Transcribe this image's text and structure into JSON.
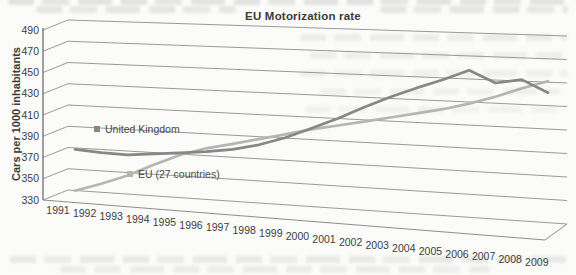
{
  "title": "EU Motorization rate",
  "y_axis": {
    "title": "Cars per 1000 inhabitants",
    "min": 330,
    "max": 490,
    "step": 20,
    "ticks": [
      330,
      350,
      370,
      390,
      410,
      430,
      450,
      470,
      490
    ]
  },
  "x_axis": {
    "years": [
      1991,
      1992,
      1993,
      1994,
      1995,
      1996,
      1997,
      1998,
      1999,
      2000,
      2001,
      2002,
      2003,
      2004,
      2005,
      2006,
      2007,
      2008,
      2009
    ]
  },
  "chart_data": {
    "type": "line",
    "title": "EU Motorization rate",
    "xlabel": "",
    "ylabel": "Cars per 1000 inhabitants",
    "ylim": [
      330,
      490
    ],
    "grid": true,
    "projection": "3d-perspective",
    "legend_position": "inline-labels",
    "categories": [
      1991,
      1992,
      1993,
      1994,
      1995,
      1996,
      1997,
      1998,
      1999,
      2000,
      2001,
      2002,
      2003,
      2004,
      2005,
      2006,
      2007,
      2008,
      2009
    ],
    "series": [
      {
        "name": "EU (27 countries)",
        "color": "#b5b5b5",
        "values": [
          335,
          343,
          352,
          363,
          373,
          380,
          385,
          390,
          395,
          400,
          404,
          408,
          412,
          416,
          420,
          425,
          431,
          438,
          444
        ]
      },
      {
        "name": "United Kingdom",
        "color": "#878787",
        "values": [
          374,
          372,
          371,
          373,
          375,
          377,
          380,
          385,
          392,
          401,
          410,
          420,
          429,
          437,
          444,
          452,
          442,
          445,
          435
        ]
      }
    ]
  },
  "colors": {
    "background": "#fbfbf9",
    "grid": "#8d8d8d",
    "axis": "#6e6e6e",
    "text": "#3d3d3d",
    "uk_line": "#878787",
    "eu_line": "#b5b5b5"
  }
}
